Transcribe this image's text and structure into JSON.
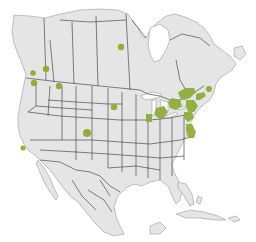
{
  "map": {
    "title": "North America highlighted locations",
    "region": "North America (Canada, United States, Mexico, Caribbean)",
    "colors": {
      "background": "#ffffff",
      "land": "#e4e5e4",
      "border": "#4a4a4a",
      "water": "#ffffff",
      "highlight": "#8fae3a"
    },
    "markers": [
      {
        "id": "manitoba-north",
        "type": "dot",
        "x": 121,
        "y": 47,
        "r": 3.2
      },
      {
        "id": "alberta",
        "type": "dot",
        "x": 46,
        "y": 69,
        "r": 3.2
      },
      {
        "id": "vancouver",
        "type": "dot",
        "x": 33,
        "y": 73,
        "r": 2.8
      },
      {
        "id": "seattle",
        "type": "dot",
        "x": 34,
        "y": 83,
        "r": 3.2
      },
      {
        "id": "montana-idaho",
        "type": "dot",
        "x": 59,
        "y": 86,
        "r": 3.2
      },
      {
        "id": "south-dakota",
        "type": "dot",
        "x": 114,
        "y": 107,
        "r": 3.2
      },
      {
        "id": "colorado",
        "type": "dot",
        "x": 87,
        "y": 133,
        "r": 4.0
      },
      {
        "id": "california-bay",
        "type": "dot",
        "x": 23,
        "y": 148,
        "r": 2.5
      },
      {
        "id": "new-brunswick",
        "type": "dot",
        "x": 209,
        "y": 89,
        "r": 3.0
      }
    ],
    "regions": [
      {
        "id": "ontario-quebec",
        "type": "area"
      },
      {
        "id": "michigan",
        "type": "area"
      },
      {
        "id": "illinois",
        "type": "area"
      },
      {
        "id": "new-england",
        "type": "area"
      },
      {
        "id": "new-york",
        "type": "area"
      },
      {
        "id": "mid-atlantic",
        "type": "area"
      },
      {
        "id": "virginia",
        "type": "area"
      }
    ]
  }
}
